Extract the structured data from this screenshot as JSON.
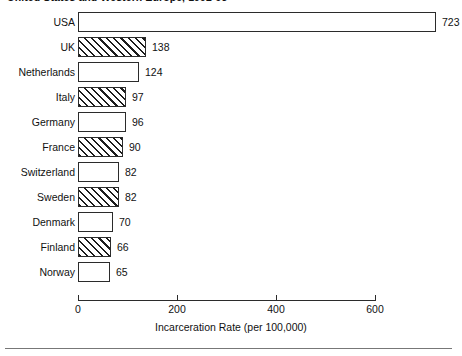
{
  "chart_data": {
    "type": "bar",
    "orientation": "horizontal",
    "title": "United States and Western Europe, 1992-93",
    "xlabel": "Incarceration Rate (per 100,000)",
    "ylabel": "",
    "xlim": [
      0,
      723
    ],
    "axis_max_tick": 600,
    "xticks": [
      0,
      200,
      400,
      600
    ],
    "xticklabels": [
      "0",
      "200",
      "400",
      "600"
    ],
    "grid": false,
    "legend": false,
    "categories": [
      "USA",
      "UK",
      "Netherlands",
      "Italy",
      "Germany",
      "France",
      "Switzerland",
      "Sweden",
      "Denmark",
      "Finland",
      "Norway"
    ],
    "values": [
      723,
      138,
      124,
      97,
      96,
      90,
      82,
      82,
      70,
      66,
      65
    ],
    "value_labels": [
      "723",
      "138",
      "124",
      "97",
      "96",
      "90",
      "82",
      "82",
      "70",
      "66",
      "65"
    ],
    "bar_fills": [
      "plain",
      "hatched",
      "plain",
      "hatched",
      "plain",
      "hatched",
      "plain",
      "hatched",
      "plain",
      "hatched",
      "plain"
    ],
    "colors": {
      "bar_edge": "#2b2b2b",
      "bar_face": "#ffffff",
      "hatch": "#1c1c1c",
      "axis": "#2b2b2b",
      "text": "#111111",
      "rule": "#777777",
      "background": "#ffffff"
    }
  }
}
